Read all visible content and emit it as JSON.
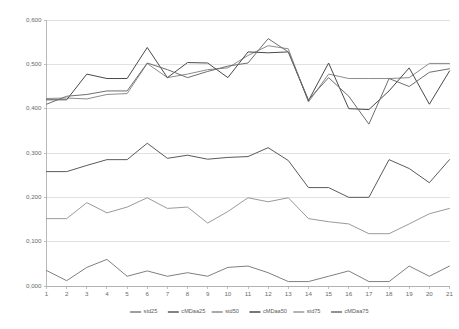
{
  "chart_data": {
    "type": "line",
    "title": "",
    "subtitle": "",
    "xlabel": "",
    "ylabel": "",
    "decimal_separator": ",",
    "grid": true,
    "legend_position": "bottom",
    "xlim": [
      1,
      21
    ],
    "ylim": [
      0.0,
      0.6
    ],
    "ytick_labels": [
      "0,600",
      "0,500",
      "0,400",
      "0,300",
      "0,200",
      "0,100",
      "0,000"
    ],
    "ytick_values": [
      0.6,
      0.5,
      0.4,
      0.3,
      0.2,
      0.1,
      0.0
    ],
    "categories": [
      "1",
      "2",
      "3",
      "4",
      "5",
      "6",
      "7",
      "8",
      "9",
      "10",
      "11",
      "12",
      "13",
      "14",
      "15",
      "16",
      "17",
      "18",
      "19",
      "20",
      "21"
    ],
    "x": [
      1,
      2,
      3,
      4,
      5,
      6,
      7,
      8,
      9,
      10,
      11,
      12,
      13,
      14,
      15,
      16,
      17,
      18,
      19,
      20,
      21
    ],
    "series": [
      {
        "name": "std25",
        "color": "#7f7f7f",
        "values": [
          0.035,
          0.012,
          0.042,
          0.06,
          0.022,
          0.034,
          0.022,
          0.03,
          0.022,
          0.042,
          0.045,
          0.03,
          0.01,
          0.01,
          0.022,
          0.034,
          0.01,
          0.01,
          0.045,
          0.022,
          0.045
        ]
      },
      {
        "name": "cMDaa25",
        "color": "#5a5a5a",
        "values": [
          0.258,
          0.258,
          0.272,
          0.285,
          0.285,
          0.322,
          0.288,
          0.295,
          0.286,
          0.29,
          0.292,
          0.312,
          0.283,
          0.222,
          0.222,
          0.2,
          0.2,
          0.285,
          0.265,
          0.233,
          0.285
        ]
      },
      {
        "name": "std50",
        "color": "#8c8c8c",
        "values": [
          0.423,
          0.424,
          0.422,
          0.432,
          0.434,
          0.502,
          0.47,
          0.478,
          0.488,
          0.492,
          0.52,
          0.542,
          0.535,
          0.415,
          0.478,
          0.468,
          0.468,
          0.468,
          0.47,
          0.502,
          0.502
        ]
      },
      {
        "name": "cMDaa50",
        "color": "#4a4a4a",
        "values": [
          0.42,
          0.42,
          0.478,
          0.468,
          0.468,
          0.538,
          0.47,
          0.504,
          0.503,
          0.47,
          0.528,
          0.526,
          0.528,
          0.418,
          0.503,
          0.4,
          0.398,
          0.44,
          0.492,
          0.41,
          0.485
        ]
      },
      {
        "name": "std75",
        "color": "#9a9a9a",
        "values": [
          0.152,
          0.152,
          0.188,
          0.165,
          0.178,
          0.199,
          0.175,
          0.178,
          0.142,
          0.168,
          0.199,
          0.19,
          0.199,
          0.152,
          0.145,
          0.14,
          0.118,
          0.118,
          0.14,
          0.163,
          0.175
        ]
      },
      {
        "name": "cMDaa75",
        "color": "#6e6e6e",
        "values": [
          0.41,
          0.428,
          0.432,
          0.44,
          0.44,
          0.503,
          0.488,
          0.47,
          0.484,
          0.496,
          0.503,
          0.558,
          0.528,
          0.42,
          0.47,
          0.428,
          0.365,
          0.468,
          0.45,
          0.482,
          0.49
        ]
      }
    ],
    "legend_entries": [
      {
        "label": "std25",
        "color": "#7f7f7f"
      },
      {
        "label": "cMDaa25",
        "color": "#5a5a5a"
      },
      {
        "label": "std50",
        "color": "#8c8c8c"
      },
      {
        "label": "cMDaa50",
        "color": "#4a4a4a"
      },
      {
        "label": "std75",
        "color": "#9a9a9a"
      },
      {
        "label": "cMDaa75",
        "color": "#6e6e6e"
      }
    ]
  },
  "axes": {
    "y_labels": [
      "0,600",
      "0,500",
      "0,400",
      "0,300",
      "0,200",
      "0,100",
      "0,000"
    ],
    "x_labels": [
      "1",
      "2",
      "3",
      "4",
      "5",
      "6",
      "7",
      "8",
      "9",
      "10",
      "11",
      "12",
      "13",
      "14",
      "15",
      "16",
      "17",
      "18",
      "19",
      "20",
      "21"
    ]
  },
  "legend": {
    "labels": [
      "std25",
      "cMDaa25",
      "std50",
      "cMDaa50",
      "std75",
      "cMDaa75"
    ]
  },
  "colors": {
    "gridline": "#d4d4d4",
    "axis": "#a6a6a6",
    "text": "#6b6b6b",
    "background": "#ffffff"
  }
}
